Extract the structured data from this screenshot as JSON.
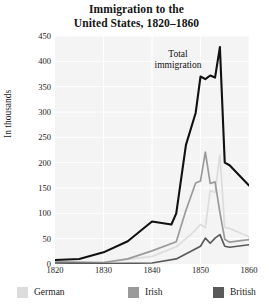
{
  "chart_data": {
    "type": "line",
    "title": "Immigration to the United States, 1820–1860",
    "title_line1": "Immigration to the",
    "title_line2": "United States, 1820–1860",
    "xlabel": "",
    "ylabel": "In thousands",
    "xlim": [
      1820,
      1860
    ],
    "ylim": [
      0,
      450
    ],
    "ytick_labels": [
      "450",
      "400",
      "350",
      "300",
      "250",
      "200",
      "150",
      "100",
      "50",
      "0"
    ],
    "ytick_values": [
      450,
      400,
      350,
      300,
      250,
      200,
      150,
      100,
      50,
      0
    ],
    "xtick_labels": [
      "1820",
      "1830",
      "1840",
      "1850",
      "1860"
    ],
    "xtick_values": [
      1820,
      1830,
      1840,
      1850,
      1860
    ],
    "grid": true,
    "legend_position": "bottom",
    "annotations": [
      {
        "text": "Total immigration",
        "line1": "Total",
        "line2": "immigration",
        "x": 1849,
        "y": 400
      }
    ],
    "series": [
      {
        "name": "Total immigration",
        "color": "#111111",
        "in_legend": false,
        "x": [
          1820,
          1825,
          1830,
          1835,
          1840,
          1844,
          1845,
          1847,
          1849,
          1850,
          1851,
          1852,
          1853,
          1854,
          1855,
          1856,
          1860
        ],
        "values": [
          8,
          10,
          23,
          45,
          84,
          78,
          100,
          235,
          298,
          370,
          365,
          372,
          368,
          428,
          200,
          195,
          155
        ]
      },
      {
        "name": "German",
        "color": "#dcdcdc",
        "in_legend": true,
        "x": [
          1820,
          1830,
          1835,
          1840,
          1845,
          1848,
          1850,
          1851,
          1852,
          1853,
          1854,
          1855,
          1856,
          1860
        ],
        "values": [
          1,
          2,
          9,
          15,
          34,
          58,
          78,
          72,
          145,
          141,
          215,
          72,
          70,
          54
        ]
      },
      {
        "name": "Irish",
        "color": "#9a9a9a",
        "in_legend": true,
        "x": [
          1820,
          1830,
          1835,
          1840,
          1845,
          1847,
          1849,
          1850,
          1851,
          1852,
          1853,
          1854,
          1855,
          1856,
          1860
        ],
        "values": [
          4,
          3,
          10,
          26,
          44,
          106,
          160,
          164,
          221,
          159,
          162,
          102,
          49,
          43,
          48
        ]
      },
      {
        "name": "British",
        "color": "#5a5a5a",
        "in_legend": true,
        "x": [
          1820,
          1830,
          1840,
          1845,
          1850,
          1851,
          1852,
          1853,
          1854,
          1855,
          1856,
          1860
        ],
        "values": [
          2,
          1,
          2,
          10,
          35,
          51,
          41,
          51,
          58,
          35,
          33,
          38
        ]
      }
    ]
  },
  "legend": {
    "items": [
      {
        "label": "German",
        "color": "#dcdcdc"
      },
      {
        "label": "Irish",
        "color": "#9a9a9a"
      },
      {
        "label": "British",
        "color": "#5a5a5a"
      }
    ]
  }
}
